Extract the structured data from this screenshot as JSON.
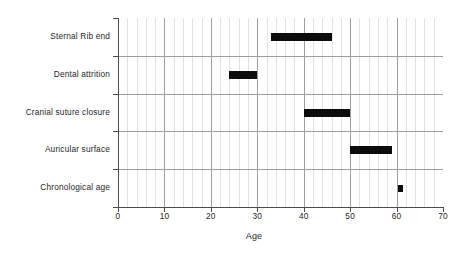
{
  "chart_data": {
    "type": "bar",
    "orientation": "horizontal",
    "subtype": "range-bar",
    "title": "",
    "xlabel": "Age",
    "ylabel": "",
    "xlim": [
      0,
      70
    ],
    "xticks": [
      0,
      10,
      20,
      30,
      40,
      50,
      60,
      70
    ],
    "xtick_labels": [
      "0",
      "10",
      "20",
      "30",
      "40",
      "50",
      "60",
      "70"
    ],
    "x_minor_tick_step": 2,
    "grid": true,
    "grid_axis": "both",
    "legend": null,
    "bar_color": "#0b0b0b",
    "grid_major_color": "#9d9d9d",
    "grid_minor_color": "#e3e3e3",
    "axis_color": "#4a4a4a",
    "background": "#ffffff",
    "categories": [
      "Sternal Rib end",
      "Dental attrition",
      "Cranial suture closure",
      "Auricular surface",
      "Chronological age"
    ],
    "ranges": [
      {
        "category": "Sternal Rib end",
        "start": 33.0,
        "end": 46.0
      },
      {
        "category": "Dental attrition",
        "start": 24.0,
        "end": 30.0
      },
      {
        "category": "Cranial suture closure",
        "start": 40.0,
        "end": 50.0
      },
      {
        "category": "Auricular surface",
        "start": 50.0,
        "end": 59.0
      },
      {
        "category": "Chronological age",
        "start": 60.3,
        "end": 61.0
      }
    ]
  },
  "axis": {
    "x_title": "Age",
    "tick_0": "0",
    "tick_10": "10",
    "tick_20": "20",
    "tick_30": "30",
    "tick_40": "40",
    "tick_50": "50",
    "tick_60": "60",
    "tick_70": "70"
  },
  "rows": [
    {
      "label": "Sternal Rib end"
    },
    {
      "label": "Dental attrition"
    },
    {
      "label": "Cranial suture closure"
    },
    {
      "label": "Auricular surface"
    },
    {
      "label": "Chronological age"
    }
  ]
}
